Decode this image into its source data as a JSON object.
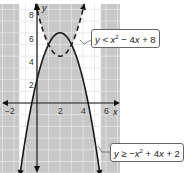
{
  "chart_data": {
    "type": "line",
    "title": "",
    "xlabel": "x",
    "ylabel": "y",
    "xlim": [
      -3,
      7
    ],
    "ylim": [
      -6,
      8.5
    ],
    "grid": true,
    "x_ticks": [
      "-2",
      "2",
      "4",
      "6"
    ],
    "y_ticks": [
      "2",
      "4",
      "6",
      "8"
    ],
    "series": [
      {
        "name": "y < x^2 - 4x + 8",
        "style": "dashed",
        "equation": "y = x^2 - 4x + 8",
        "vertex": [
          2,
          4
        ],
        "points": [
          [
            -0.1,
            8.4
          ],
          [
            0,
            8
          ],
          [
            1,
            5
          ],
          [
            2,
            4
          ],
          [
            3,
            5
          ],
          [
            4,
            8
          ],
          [
            4.1,
            8.4
          ]
        ]
      },
      {
        "name": "y >= -x^2 + 4x + 2",
        "style": "solid",
        "equation": "y = -x^2 + 4x + 2",
        "vertex": [
          2,
          6
        ],
        "points": [
          [
            -1.6,
            -11
          ],
          [
            -1,
            -3
          ],
          [
            0,
            2
          ],
          [
            1,
            5
          ],
          [
            2,
            6
          ],
          [
            3,
            5
          ],
          [
            4,
            2
          ],
          [
            5,
            -3
          ],
          [
            5.6,
            -11
          ]
        ]
      }
    ],
    "intersections": [
      [
        1,
        5
      ],
      [
        3,
        5
      ]
    ],
    "shading": "gray outside solution region; solution region (between parabolas) left white",
    "annotations": [
      {
        "text": "y < x² − 4x + 8",
        "target": "dashed parabola"
      },
      {
        "text": "y ≥ −x² + 4x + 2",
        "target": "solid parabola"
      }
    ]
  },
  "labels": {
    "dashed": {
      "lhs": "y",
      "rel": " < ",
      "rhs_a": "x",
      "sup": "2",
      "rhs_b": " − 4",
      "rhs_c": "x",
      "rhs_d": " + 8"
    },
    "solid": {
      "lhs": "y",
      "rel": " ≥ −",
      "rhs_a": "x",
      "sup": "2",
      "rhs_b": " + 4",
      "rhs_c": "x",
      "rhs_d": " + 2"
    }
  },
  "axes": {
    "x_name": "x",
    "y_name": "y",
    "ticks_x": {
      "m2": "−2",
      "p2": "2",
      "p4": "4",
      "p6": "6"
    },
    "ticks_y": {
      "p2": "2",
      "p4": "4",
      "p6": "6",
      "p8": "8"
    }
  },
  "colors": {
    "shade": "#c8c8c8",
    "grid": "#ffffff",
    "grid_on_white": "#d6d6d6",
    "curve": "#1a1a1a"
  }
}
